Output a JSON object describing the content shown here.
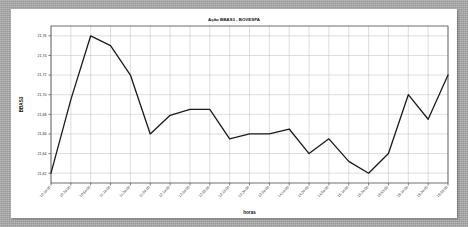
{
  "chart_data": {
    "type": "line",
    "title": "Ação BBAS3 - BOVESPA",
    "xlabel": "horas",
    "ylabel": "BBAS3",
    "grid": true,
    "legend": null,
    "ylim": [
      21.61,
      21.77
    ],
    "yticks": [
      "21,76",
      "21,74",
      "21,72",
      "21,70",
      "21,68",
      "21,66",
      "21,64",
      "21,62"
    ],
    "ytick_values": [
      21.76,
      21.74,
      21.72,
      21.7,
      21.68,
      21.66,
      21.64,
      21.62
    ],
    "categories": [
      "10:14:00",
      "10:24:00",
      "10:54:00",
      "11:14:00",
      "11:34:00",
      "11:54:00",
      "12:14:00",
      "12:34:00",
      "12:53:00",
      "13:13:00",
      "13:34:00",
      "13:54:00",
      "14:14:00",
      "14:34:00",
      "14:54:00",
      "15:14:00",
      "15:34:00",
      "15:53:00",
      "16:14:00",
      "16:34:00",
      "16:53:00"
    ],
    "values": [
      21.62,
      21.695,
      21.76,
      21.75,
      21.72,
      21.66,
      21.679,
      21.685,
      21.685,
      21.655,
      21.66,
      21.66,
      21.665,
      21.64,
      21.655,
      21.632,
      21.62,
      21.64,
      21.7,
      21.675,
      21.72
    ],
    "series": [
      {
        "name": "BBAS3",
        "color": "#1a1a1a",
        "values": [
          21.62,
          21.695,
          21.76,
          21.75,
          21.72,
          21.66,
          21.679,
          21.685,
          21.685,
          21.655,
          21.66,
          21.66,
          21.665,
          21.64,
          21.655,
          21.632,
          21.62,
          21.64,
          21.7,
          21.675,
          21.72
        ]
      }
    ]
  },
  "style": {
    "panel_bg": "#ffffff",
    "page_bg": "#a8a8a8",
    "grid_color": "#b9b9c8",
    "axis_color": "#4a4a4a",
    "line_color": "#1a1a1a"
  }
}
